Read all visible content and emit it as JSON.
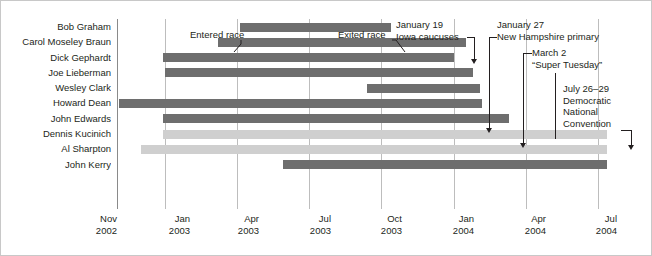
{
  "chart_data": {
    "type": "bar",
    "orientation": "horizontal",
    "subtype": "timeline-gantt",
    "title": "",
    "xlabel": "",
    "ylabel": "",
    "grid": true,
    "legend_position": "none",
    "x_axis": {
      "unit": "months",
      "start": "2002-11",
      "end": "2004-08",
      "ticks": [
        {
          "month": "Nov",
          "year": "2002",
          "pos": 0
        },
        {
          "month": "Jan",
          "year": "2003",
          "pos": 2
        },
        {
          "month": "Apr",
          "year": "2003",
          "pos": 5
        },
        {
          "month": "Jul",
          "year": "2003",
          "pos": 8
        },
        {
          "month": "Oct",
          "year": "2003",
          "pos": 11
        },
        {
          "month": "Jan",
          "year": "2004",
          "pos": 14
        },
        {
          "month": "Apr",
          "year": "2004",
          "pos": 17
        },
        {
          "month": "Jul",
          "year": "2004",
          "pos": 20
        }
      ]
    },
    "colors": {
      "exited": "#6e6e6e",
      "active": "#cfcfcf",
      "gridline": "#bdbdbd",
      "axis": "#8a8a8a",
      "text": "#231f20"
    },
    "categories": [
      "Bob Graham",
      "Carol Moseley Braun",
      "Dick Gephardt",
      "Joe Lieberman",
      "Wesley Clark",
      "Howard Dean",
      "John Edwards",
      "Dennis Kucinich",
      "Al Sharpton",
      "John Kerry"
    ],
    "bars": [
      {
        "label": "Bob Graham",
        "start_month": 5.1,
        "end_month": 11.4,
        "status": "exited"
      },
      {
        "label": "Carol Moseley Braun",
        "start_month": 4.2,
        "end_month": 14.5,
        "status": "exited"
      },
      {
        "label": "Dick Gephardt",
        "start_month": 1.9,
        "end_month": 14.0,
        "status": "exited"
      },
      {
        "label": "Joe Lieberman",
        "start_month": 2.0,
        "end_month": 14.8,
        "status": "exited"
      },
      {
        "label": "Wesley Clark",
        "start_month": 10.4,
        "end_month": 15.1,
        "status": "exited"
      },
      {
        "label": "Howard Dean",
        "start_month": 0.1,
        "end_month": 15.2,
        "status": "exited"
      },
      {
        "label": "John Edwards",
        "start_month": 1.9,
        "end_month": 16.3,
        "status": "exited"
      },
      {
        "label": "Dennis Kucinich",
        "start_month": 1.9,
        "end_month": 20.4,
        "status": "active"
      },
      {
        "label": "Al Sharpton",
        "start_month": 1.0,
        "end_month": 20.4,
        "status": "active"
      },
      {
        "label": "John Kerry",
        "start_month": 6.9,
        "end_month": 20.4,
        "status": "exited"
      }
    ],
    "annotations": [
      {
        "id": "entered-race",
        "lines": [
          "Entered race"
        ]
      },
      {
        "id": "exited-race",
        "lines": [
          "Exited race"
        ]
      },
      {
        "id": "iowa-caucuses",
        "lines": [
          "January 19",
          "Iowa caucuses"
        ]
      },
      {
        "id": "new-hampshire",
        "lines": [
          "January 27",
          "New Hampshire primary"
        ]
      },
      {
        "id": "super-tuesday",
        "lines": [
          "March 2",
          "“Super Tuesday”"
        ]
      },
      {
        "id": "dnc-convention",
        "lines": [
          "July 26–29",
          "Democratic",
          "National",
          "Convention"
        ]
      }
    ]
  },
  "names": {
    "n0": "Bob Graham",
    "n1": "Carol Moseley Braun",
    "n2": "Dick Gephardt",
    "n3": "Joe Lieberman",
    "n4": "Wesley Clark",
    "n5": "Howard Dean",
    "n6": "John Edwards",
    "n7": "Dennis Kucinich",
    "n8": "Al Sharpton",
    "n9": "John Kerry"
  },
  "ticks": {
    "t0m": "Nov",
    "t0y": "2002",
    "t1m": "Jan",
    "t1y": "2003",
    "t2m": "Apr",
    "t2y": "2003",
    "t3m": "Jul",
    "t3y": "2003",
    "t4m": "Oct",
    "t4y": "2003",
    "t5m": "Jan",
    "t5y": "2004",
    "t6m": "Apr",
    "t6y": "2004",
    "t7m": "Jul",
    "t7y": "2004"
  },
  "annotations": {
    "entered_race": "Entered race",
    "exited_race": "Exited race",
    "iowa_line1": "January 19",
    "iowa_line2": "Iowa caucuses",
    "nh_line1": "January 27",
    "nh_line2": "New Hampshire primary",
    "super_line1": "March 2",
    "super_line2": "“Super Tuesday”",
    "dnc_line1": "July 26–29",
    "dnc_line2": "Democratic",
    "dnc_line3": "National",
    "dnc_line4": "Convention"
  }
}
